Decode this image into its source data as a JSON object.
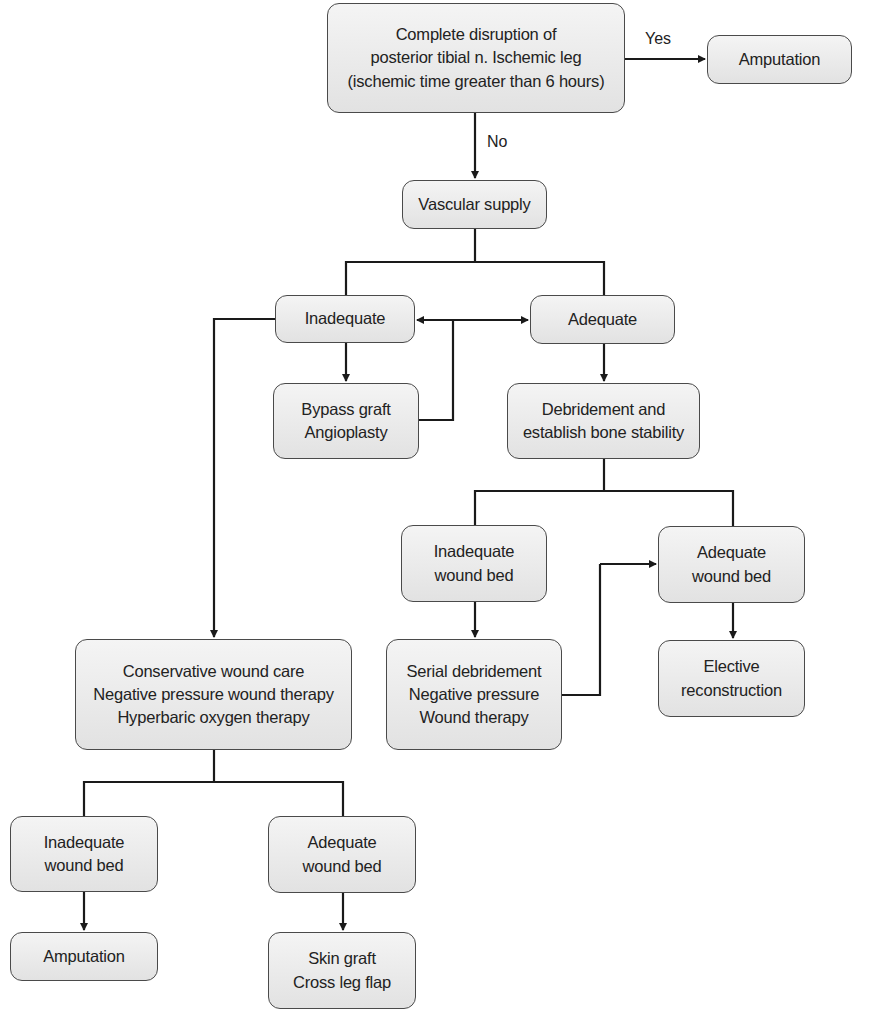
{
  "nodes": {
    "root": {
      "lines": [
        "Complete disruption of",
        "posterior tibial n. Ischemic leg",
        "(ischemic time greater than 6 hours)"
      ]
    },
    "amputation_top": {
      "lines": [
        "Amputation"
      ]
    },
    "vascular": {
      "lines": [
        "Vascular supply"
      ]
    },
    "inadequate": {
      "lines": [
        "Inadequate"
      ]
    },
    "adequate": {
      "lines": [
        "Adequate"
      ]
    },
    "bypass": {
      "lines": [
        "Bypass graft",
        "Angioplasty"
      ]
    },
    "debridement": {
      "lines": [
        "Debridement and",
        "establish bone stability"
      ]
    },
    "inadequate_bed_mid": {
      "lines": [
        "Inadequate",
        "wound bed"
      ]
    },
    "adequate_bed_right": {
      "lines": [
        "Adequate",
        "wound bed"
      ]
    },
    "serial": {
      "lines": [
        "Serial debridement",
        "Negative pressure",
        "Wound therapy"
      ]
    },
    "elective": {
      "lines": [
        "Elective",
        "reconstruction"
      ]
    },
    "conservative": {
      "lines": [
        "Conservative wound care",
        "Negative pressure wound therapy",
        "Hyperbaric oxygen therapy"
      ]
    },
    "inadequate_bed_bottom": {
      "lines": [
        "Inadequate",
        "wound bed"
      ]
    },
    "adequate_bed_bottom": {
      "lines": [
        "Adequate",
        "wound bed"
      ]
    },
    "amputation_bottom": {
      "lines": [
        "Amputation"
      ]
    },
    "skin_graft": {
      "lines": [
        "Skin graft",
        "Cross leg flap"
      ]
    }
  },
  "edge_labels": {
    "yes": "Yes",
    "no": "No"
  },
  "colors": {
    "box_fill_top": "#f4f4f4",
    "box_fill_bottom": "#e2e2e2",
    "stroke": "#1a1a1a"
  }
}
